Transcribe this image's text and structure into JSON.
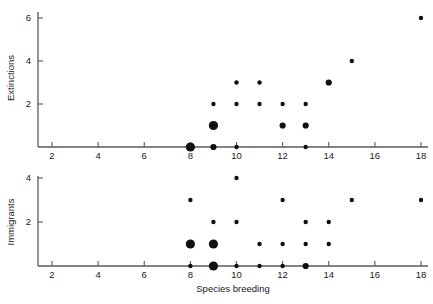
{
  "figure": {
    "background_color": "#ffffff",
    "axis_color": "#5a5a5a",
    "point_color": "#101010",
    "xlabel": "Species breeding"
  },
  "chart_data": [
    {
      "type": "scatter",
      "title": "",
      "xlabel": "Species breeding",
      "ylabel": "Extinctions",
      "xlim": [
        1,
        18.6
      ],
      "ylim": [
        0,
        6.3
      ],
      "xticks": [
        2,
        4,
        6,
        8,
        10,
        12,
        14,
        16,
        18
      ],
      "yticks": [
        2,
        4,
        6
      ],
      "grid": false,
      "legend": null,
      "points": [
        {
          "x": 8,
          "y": 0,
          "size": "large"
        },
        {
          "x": 9,
          "y": 0,
          "size": "medium"
        },
        {
          "x": 10,
          "y": 0,
          "size": "small"
        },
        {
          "x": 13,
          "y": 0,
          "size": "small"
        },
        {
          "x": 9,
          "y": 1,
          "size": "large"
        },
        {
          "x": 12,
          "y": 1,
          "size": "medium"
        },
        {
          "x": 13,
          "y": 1,
          "size": "medium"
        },
        {
          "x": 9,
          "y": 2,
          "size": "small"
        },
        {
          "x": 10,
          "y": 2,
          "size": "small"
        },
        {
          "x": 11,
          "y": 2,
          "size": "small"
        },
        {
          "x": 12,
          "y": 2,
          "size": "small"
        },
        {
          "x": 13,
          "y": 2,
          "size": "small"
        },
        {
          "x": 10,
          "y": 3,
          "size": "small"
        },
        {
          "x": 11,
          "y": 3,
          "size": "small"
        },
        {
          "x": 14,
          "y": 3,
          "size": "medium"
        },
        {
          "x": 15,
          "y": 4,
          "size": "small"
        },
        {
          "x": 18,
          "y": 6,
          "size": "small"
        }
      ]
    },
    {
      "type": "scatter",
      "title": "",
      "xlabel": "Species breeding",
      "ylabel": "Immigrants",
      "xlim": [
        1,
        18.6
      ],
      "ylim": [
        0,
        4.3
      ],
      "xticks": [
        2,
        4,
        6,
        8,
        10,
        12,
        14,
        16,
        18
      ],
      "yticks": [
        2,
        4
      ],
      "grid": false,
      "legend": null,
      "points": [
        {
          "x": 8,
          "y": 0,
          "size": "small"
        },
        {
          "x": 9,
          "y": 0,
          "size": "large"
        },
        {
          "x": 10,
          "y": 0,
          "size": "small"
        },
        {
          "x": 11,
          "y": 0,
          "size": "small"
        },
        {
          "x": 12,
          "y": 0,
          "size": "small"
        },
        {
          "x": 13,
          "y": 0,
          "size": "medium"
        },
        {
          "x": 8,
          "y": 1,
          "size": "large"
        },
        {
          "x": 9,
          "y": 1,
          "size": "large"
        },
        {
          "x": 11,
          "y": 1,
          "size": "small"
        },
        {
          "x": 12,
          "y": 1,
          "size": "small"
        },
        {
          "x": 13,
          "y": 1,
          "size": "small"
        },
        {
          "x": 14,
          "y": 1,
          "size": "small"
        },
        {
          "x": 9,
          "y": 2,
          "size": "small"
        },
        {
          "x": 10,
          "y": 2,
          "size": "small"
        },
        {
          "x": 13,
          "y": 2,
          "size": "small"
        },
        {
          "x": 14,
          "y": 2,
          "size": "small"
        },
        {
          "x": 8,
          "y": 3,
          "size": "small"
        },
        {
          "x": 12,
          "y": 3,
          "size": "small"
        },
        {
          "x": 15,
          "y": 3,
          "size": "small"
        },
        {
          "x": 18,
          "y": 3,
          "size": "small"
        },
        {
          "x": 10,
          "y": 4,
          "size": "small"
        }
      ]
    }
  ]
}
